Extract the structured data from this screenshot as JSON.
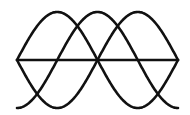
{
  "diagram": {
    "title": "",
    "colors": {
      "stroke": "#111111",
      "background": "#ffffff"
    },
    "axis": {
      "x_start": 17,
      "x_end": 178,
      "y": 60
    },
    "amplitude": 48,
    "period": 322,
    "phases": [
      {
        "name": "phase-a",
        "phase_shift_deg": 0
      },
      {
        "name": "phase-b",
        "phase_shift_deg": 180
      },
      {
        "name": "phase-c",
        "phase_shift_deg": -90
      }
    ]
  }
}
